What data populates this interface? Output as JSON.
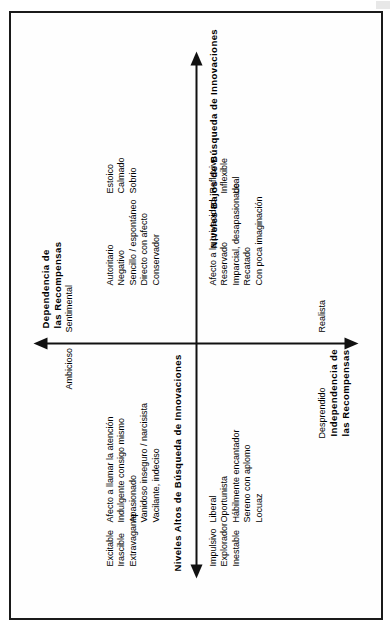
{
  "diagram": {
    "type": "four-quadrant-personality-map",
    "axes": {
      "horizontal": {
        "left_title": "Niveles Altos de Búsqueda de Innovaciones",
        "right_title": "Niveles Bajos de Búsqueda de Innovaciones",
        "left_arrow": "arrow-left-icon",
        "right_arrow": "arrow-right-icon"
      },
      "vertical": {
        "top_title": "Dependencia de las Recompensas",
        "top_title_line1": "Dependencia de",
        "top_title_line2": "las Recompensas",
        "bottom_title": "Independencia de las Recompensas",
        "bottom_title_line1": "Independencia de",
        "bottom_title_line2": "las Recompensas",
        "top_arrow": "arrow-up-icon",
        "bottom_arrow": "arrow-down-icon"
      }
    },
    "poles": {
      "top_left": "Ambicioso",
      "top_right": "Sentimental",
      "bottom_left": "Desprendido",
      "bottom_right": "Realista"
    },
    "quadrants": {
      "upper_left": {
        "group_a": [
          "Excitable",
          "Irascible",
          "Extravagante"
        ],
        "group_b": [
          "Afecto a llamar la atención",
          "Indulgente consigo mismo",
          "Apasionado",
          "Vanidoso inseguro / narcisista",
          "Vacilante, indeciso"
        ]
      },
      "lower_left": {
        "group_a": [
          "Impulsivo",
          "Explorador",
          "Inestable"
        ],
        "group_b": [
          "Liberal",
          "Oportunista",
          "Hábilmente encantador",
          "Sereno con aplomo",
          "Locuaz"
        ]
      },
      "upper_right": {
        "group_a": [
          "Autoritario",
          "Negativo",
          "Sencillo / espontáneo",
          "Directo con afecto",
          "Conservador"
        ],
        "group_b": [
          "Estoico",
          "Calmado",
          "Sobrio"
        ]
      },
      "lower_right": {
        "group_a": [
          "Afecto a la privacidad",
          "Reservado",
          "Imparcial, desapasionado",
          "Recatado",
          "Con poca imaginación"
        ],
        "group_b": [
          "Reflexivo",
          "Inflexible",
          "Leal"
        ]
      }
    },
    "colors": {
      "ink": "#111111",
      "paper": "#fefefe",
      "frame": "#1a1a1a"
    }
  }
}
